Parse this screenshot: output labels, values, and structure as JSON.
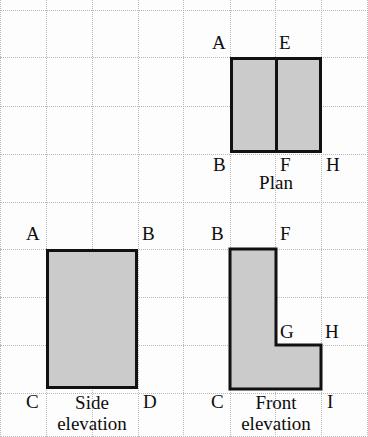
{
  "drawing": {
    "title": "Orthographic projection: plan, side elevation and front elevation",
    "background_color": "#fdfdfd",
    "fill_color": "#cbcbcb",
    "stroke_color": "#111111",
    "grid_color": "#b9b9b9"
  },
  "grid": {
    "style": "dotted",
    "column_x": [
      0,
      46,
      92,
      138,
      183,
      230,
      275,
      321,
      367
    ],
    "row_y": [
      10,
      57,
      106,
      154,
      202,
      249,
      297,
      345,
      393,
      436
    ],
    "cell_width": 46,
    "cell_height": 48
  },
  "views": {
    "plan": {
      "caption": "Plan",
      "caption_x": 276,
      "caption_y": 172,
      "rect": {
        "x": 230,
        "y": 57,
        "width": 92,
        "height": 96
      },
      "divider_x": 276,
      "labels": [
        {
          "text": "A",
          "x": 212,
          "y": 33
        },
        {
          "text": "E",
          "x": 279,
          "y": 33
        },
        {
          "text": "B",
          "x": 213,
          "y": 155
        },
        {
          "text": "F",
          "x": 280,
          "y": 155
        },
        {
          "text": "H",
          "x": 326,
          "y": 155
        }
      ]
    },
    "side_elevation": {
      "caption": "Side\nelevation",
      "caption_x": 92,
      "caption_y": 392,
      "rect": {
        "x": 46,
        "y": 249,
        "width": 92,
        "height": 140
      },
      "labels": [
        {
          "text": "A",
          "x": 26,
          "y": 224
        },
        {
          "text": "B",
          "x": 142,
          "y": 224
        },
        {
          "text": "C",
          "x": 26,
          "y": 392
        },
        {
          "text": "D",
          "x": 143,
          "y": 392
        }
      ]
    },
    "front_elevation": {
      "caption": "Front\nelevation",
      "caption_x": 276,
      "caption_y": 392,
      "outline_points": "230,249 276,249 276,345 321,345 321,389 230,389",
      "bbox": {
        "x": 230,
        "y": 249,
        "width": 91,
        "height": 140
      },
      "labels": [
        {
          "text": "B",
          "x": 211,
          "y": 224
        },
        {
          "text": "F",
          "x": 280,
          "y": 224
        },
        {
          "text": "G",
          "x": 280,
          "y": 322
        },
        {
          "text": "H",
          "x": 325,
          "y": 322
        },
        {
          "text": "C",
          "x": 211,
          "y": 392
        },
        {
          "text": "I",
          "x": 327,
          "y": 392
        }
      ]
    }
  }
}
